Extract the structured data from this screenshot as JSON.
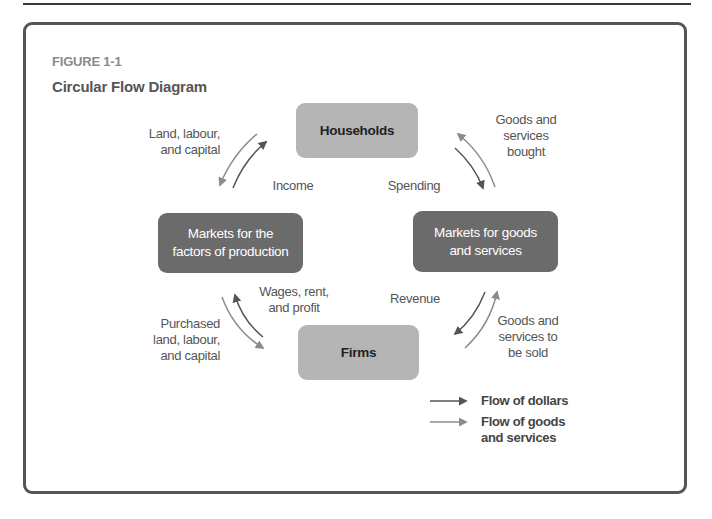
{
  "figure": {
    "label": "FIGURE 1-1",
    "title": "Circular Flow Diagram"
  },
  "nodes": {
    "households": "Households",
    "factor_markets": "Markets for the\nfactors of production",
    "goods_markets": "Markets for goods\nand services",
    "firms": "Firms"
  },
  "flows": {
    "land_labour_capital": "Land, labour,\nand capital",
    "income": "Income",
    "spending": "Spending",
    "goods_bought": "Goods and\nservices\nbought",
    "wages_rent_profit": "Wages, rent,\nand profit",
    "revenue": "Revenue",
    "purchased_inputs": "Purchased\nland, labour,\nand capital",
    "goods_to_be_sold": "Goods and\nservices to\nbe sold"
  },
  "legend": {
    "dollars": "Flow of dollars",
    "goods": "Flow of goods\nand services"
  },
  "colors": {
    "dollars_arrow": "#555555",
    "goods_arrow": "#8c8c8c",
    "household_firm_fill": "#b5b5b5",
    "market_fill": "#6b6b6b",
    "frame": "#555555"
  }
}
